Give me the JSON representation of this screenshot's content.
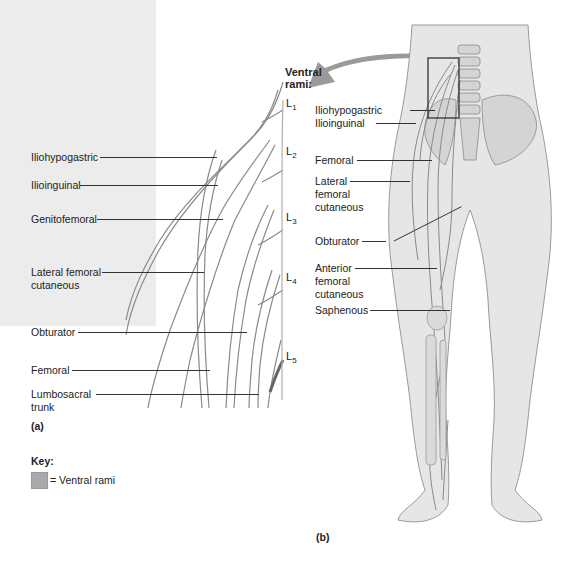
{
  "figure": {
    "panel_a": {
      "tag": "(a)",
      "ventral_rami_heading": [
        "Ventral",
        "rami:"
      ],
      "levels": [
        {
          "root": "L",
          "sub": "1"
        },
        {
          "root": "L",
          "sub": "2"
        },
        {
          "root": "L",
          "sub": "3"
        },
        {
          "root": "L",
          "sub": "4"
        },
        {
          "root": "L",
          "sub": "5"
        }
      ],
      "labels": [
        {
          "text": "Iliohypogastric"
        },
        {
          "text": "Ilioinguinal"
        },
        {
          "text": "Genitofemoral"
        },
        {
          "text": "Lateral femoral cutaneous",
          "lines": [
            "Lateral femoral",
            "cutaneous"
          ]
        },
        {
          "text": "Obturator"
        },
        {
          "text": "Femoral"
        },
        {
          "text": "Lumbosacral trunk",
          "lines": [
            "Lumbosacral",
            "trunk"
          ]
        }
      ]
    },
    "panel_b": {
      "tag": "(b)",
      "labels": [
        {
          "text": "Iliohypogastric"
        },
        {
          "text": "Ilioinguinal"
        },
        {
          "text": "Femoral"
        },
        {
          "text": "Lateral femoral cutaneous",
          "lines": [
            "Lateral",
            "femoral",
            "cutaneous"
          ]
        },
        {
          "text": "Obturator"
        },
        {
          "text": "Anterior femoral cutaneous",
          "lines": [
            "Anterior",
            "femoral",
            "cutaneous"
          ]
        },
        {
          "text": "Saphenous"
        }
      ]
    },
    "key": {
      "title": "Key:",
      "items": [
        {
          "swatch_color": "#a9a9a9",
          "text": "= Ventral rami"
        }
      ]
    },
    "colors": {
      "panel_bg": "#ececec",
      "nerve_stroke": "#8a8a8a",
      "nerve_fill": "#dcdcdc",
      "arrow": "#9a9a9a",
      "body_fill": "#e6e6e6",
      "leader": "#333333"
    }
  }
}
